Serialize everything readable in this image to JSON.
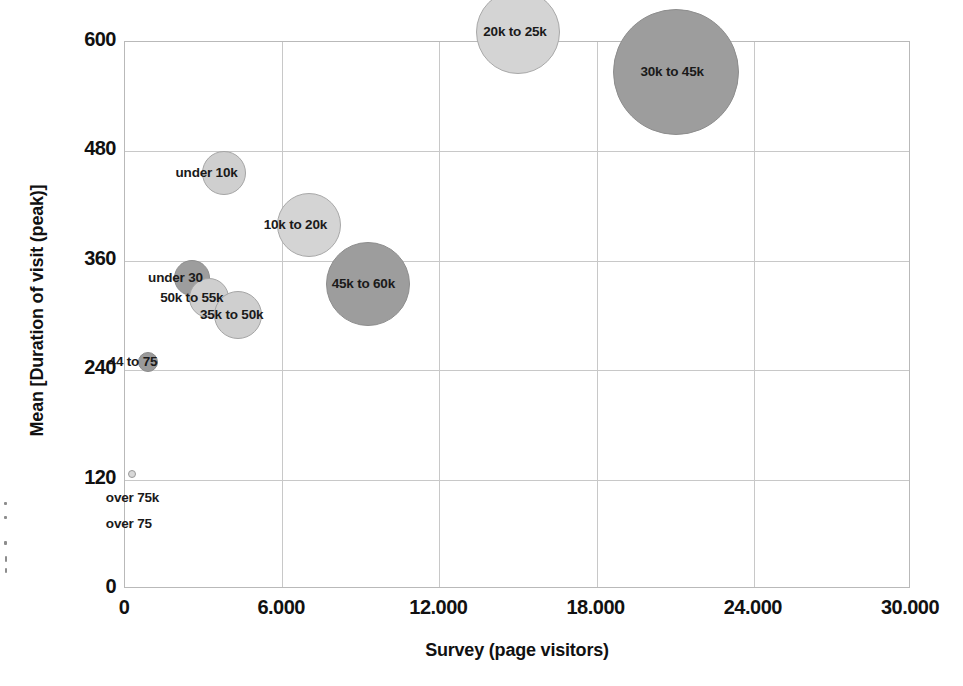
{
  "chart_data": {
    "type": "scatter",
    "title": "",
    "xlabel": "Survey (page visitors)",
    "ylabel": "Mean [Duration of visit (peak)]",
    "xlim": [
      0,
      30000
    ],
    "ylim": [
      0,
      600
    ],
    "xticks": [
      "0",
      "6.000",
      "12.000",
      "18.000",
      "24.000",
      "30.000"
    ],
    "xtick_values": [
      0,
      6000,
      12000,
      18000,
      24000,
      30000
    ],
    "yticks": [
      "0",
      "120",
      "240",
      "360",
      "480",
      "600"
    ],
    "ytick_values": [
      0,
      120,
      240,
      360,
      480,
      600
    ],
    "grid": true,
    "legend": "none",
    "bubbles": [
      {
        "label": "over 75k",
        "x": 300,
        "y": 125,
        "r": 4,
        "color": "#d8d8d8",
        "stroke": "#9a9a9a",
        "label_dx": -26,
        "label_dy": 16
      },
      {
        "label": "over 75",
        "x": 300,
        "y": 86,
        "r": 0,
        "color": "transparent",
        "stroke": "transparent",
        "label_dx": -26,
        "label_dy": 6
      },
      {
        "label": "44 to 75",
        "x": 900,
        "y": 248,
        "r": 10,
        "color": "#9a9a9a",
        "stroke": "#8a8a8a",
        "label_dx": -39,
        "label_dy": -8
      },
      {
        "label": "under 30",
        "x": 2600,
        "y": 340,
        "r": 18,
        "color": "#9d9d9d",
        "stroke": "#8d8d8d",
        "label_dx": -44,
        "label_dy": -8
      },
      {
        "label": "50k to 55k",
        "x": 3250,
        "y": 318,
        "r": 20,
        "color": "#cfcfcf",
        "stroke": "#a5a5a5",
        "label_dx": -49,
        "label_dy": -8
      },
      {
        "label": "35k to 50k",
        "x": 4350,
        "y": 300,
        "r": 24,
        "color": "#cfcfcf",
        "stroke": "#a5a5a5",
        "label_dx": -38,
        "label_dy": -8
      },
      {
        "label": "under 10k",
        "x": 3800,
        "y": 455,
        "r": 22,
        "color": "#cfcfcf",
        "stroke": "#a5a5a5",
        "label_dx": -48,
        "label_dy": -8
      },
      {
        "label": "10k to 20k",
        "x": 7050,
        "y": 398,
        "r": 32,
        "color": "#d4d4d4",
        "stroke": "#a8a8a8",
        "label_dx": -45,
        "label_dy": -8
      },
      {
        "label": "45k to 60k",
        "x": 9300,
        "y": 333,
        "r": 42,
        "color": "#9d9d9d",
        "stroke": "#8d8d8d",
        "label_dx": -36,
        "label_dy": -8
      },
      {
        "label": "20k to 25k",
        "x": 15050,
        "y": 610,
        "r": 42,
        "color": "#d4d4d4",
        "stroke": "#a8a8a8",
        "label_dx": -35,
        "label_dy": -8
      },
      {
        "label": "30k to 45k",
        "x": 21050,
        "y": 566,
        "r": 63,
        "color": "#9d9d9d",
        "stroke": "#8d8d8d",
        "label_dx": -35,
        "label_dy": -8
      }
    ]
  },
  "colors": {
    "bubble_light": "#cfcfcf",
    "bubble_dark": "#9d9d9d",
    "gridline": "#c8c8c8",
    "frame": "#b9b9b9",
    "text": "#111111"
  }
}
